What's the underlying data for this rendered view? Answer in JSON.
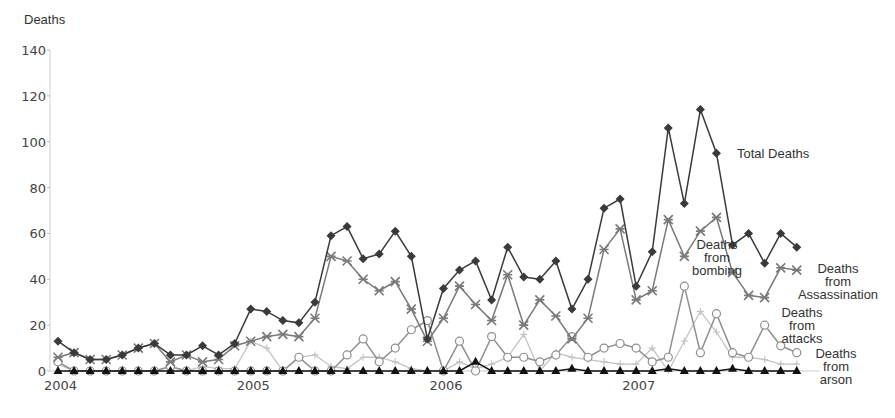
{
  "chart_data": {
    "type": "line",
    "title": "",
    "ylabel": "Deaths",
    "xlabel": "",
    "ylim": [
      0,
      140
    ],
    "yticks": [
      0,
      20,
      40,
      60,
      80,
      100,
      120,
      140
    ],
    "xtick_labels": [
      "2004",
      "2005",
      "2006",
      "2007"
    ],
    "x": [
      "2004-01",
      "2004-02",
      "2004-03",
      "2004-04",
      "2004-05",
      "2004-06",
      "2004-07",
      "2004-08",
      "2004-09",
      "2004-10",
      "2004-11",
      "2004-12",
      "2005-01",
      "2005-02",
      "2005-03",
      "2005-04",
      "2005-05",
      "2005-06",
      "2005-07",
      "2005-08",
      "2005-09",
      "2005-10",
      "2005-11",
      "2005-12",
      "2006-01",
      "2006-02",
      "2006-03",
      "2006-04",
      "2006-05",
      "2006-06",
      "2006-07",
      "2006-08",
      "2006-09",
      "2006-10",
      "2006-11",
      "2006-12",
      "2007-01",
      "2007-02",
      "2007-03",
      "2007-04",
      "2007-05",
      "2007-06",
      "2007-07",
      "2007-08",
      "2007-09",
      "2007-10",
      "2007-11",
      "2007-12"
    ],
    "grid": false,
    "legend_position": "inline-right",
    "series": [
      {
        "name": "Total Deaths",
        "marker": "diamond",
        "color": "#3a3a3a",
        "values": [
          13,
          8,
          5,
          5,
          7,
          10,
          12,
          7,
          7,
          11,
          7,
          12,
          27,
          26,
          22,
          21,
          30,
          59,
          63,
          49,
          51,
          61,
          50,
          14,
          36,
          44,
          48,
          31,
          54,
          41,
          40,
          48,
          27,
          40,
          71,
          75,
          37,
          52,
          106,
          73,
          114,
          95,
          55,
          60,
          47,
          60,
          54,
          null
        ]
      },
      {
        "name": "Deaths from Assassination",
        "marker": "asterisk",
        "color": "#7a7a7a",
        "values": [
          6,
          8,
          5,
          5,
          7,
          10,
          12,
          4,
          7,
          4,
          5,
          11,
          13,
          15,
          16,
          15,
          23,
          50,
          48,
          40,
          35,
          39,
          27,
          13,
          23,
          37,
          29,
          22,
          42,
          20,
          31,
          24,
          14,
          23,
          53,
          62,
          31,
          35,
          66,
          50,
          61,
          67,
          43,
          33,
          32,
          45,
          44,
          null
        ]
      },
      {
        "name": "Deaths from bombing",
        "marker": "plus",
        "color": "#c4c4c4",
        "values": [
          3,
          0,
          0,
          0,
          0,
          0,
          0,
          2,
          0,
          2,
          1,
          1,
          13,
          10,
          0,
          6,
          7,
          2,
          1,
          6,
          6,
          4,
          1,
          0,
          0,
          4,
          1,
          3,
          6,
          16,
          0,
          8,
          6,
          5,
          4,
          3,
          3,
          10,
          0,
          13,
          26,
          17,
          6,
          6,
          5,
          3,
          3,
          null
        ]
      },
      {
        "name": "Deaths from attacks",
        "marker": "circle",
        "color": "#8f8f8f",
        "values": [
          4,
          0,
          0,
          0,
          0,
          0,
          0,
          2,
          0,
          0,
          0,
          0,
          0,
          0,
          0,
          6,
          0,
          0,
          7,
          14,
          4,
          10,
          18,
          22,
          0,
          13,
          0,
          15,
          6,
          6,
          4,
          7,
          15,
          6,
          10,
          12,
          10,
          4,
          6,
          37,
          8,
          25,
          8,
          6,
          20,
          11,
          8,
          null
        ]
      },
      {
        "name": "Deaths from arson",
        "marker": "triangle",
        "color": "#111111",
        "values": [
          0,
          0,
          0,
          0,
          0,
          0,
          0,
          0,
          0,
          0,
          0,
          0,
          0,
          0,
          0,
          0,
          0,
          0,
          0,
          0,
          0,
          0,
          0,
          0,
          0,
          0,
          4,
          0,
          0,
          0,
          0,
          0,
          1,
          0,
          0,
          0,
          0,
          0,
          1,
          0,
          0,
          0,
          1,
          0,
          0,
          0,
          0,
          null
        ]
      }
    ],
    "annotations": [
      {
        "text": "Total Deaths",
        "series": 0
      },
      {
        "text": [
          "Deaths",
          "from",
          "Assassination"
        ],
        "series": 1
      },
      {
        "text": [
          "Deaths",
          "from",
          "bombing"
        ],
        "series": 2
      },
      {
        "text": [
          "Deaths",
          "from",
          "attacks"
        ],
        "series": 3
      },
      {
        "text": [
          "Deaths",
          "from",
          "arson"
        ],
        "series": 4
      }
    ]
  }
}
